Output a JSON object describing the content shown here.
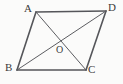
{
  "figure": {
    "kind": "geometry-diagram",
    "shape": "parallelogram",
    "background_color": "#fbfbfa",
    "stroke_color": "#55565a",
    "side_stroke_width": 1.6,
    "diagonal_stroke_width": 1.0,
    "width": 123,
    "height": 84,
    "labels": {
      "a": "A",
      "b": "B",
      "c": "C",
      "d": "D",
      "o": "O"
    },
    "vertices": [
      {
        "name": "A",
        "x": 36,
        "y": 12
      },
      {
        "name": "D",
        "x": 106,
        "y": 11
      },
      {
        "name": "C",
        "x": 86,
        "y": 70
      },
      {
        "name": "B",
        "x": 17,
        "y": 70
      },
      {
        "name": "O",
        "x": 58,
        "y": 42
      }
    ],
    "edges": [
      {
        "name": "AD",
        "from": "A",
        "to": "D",
        "type": "side"
      },
      {
        "name": "DC",
        "from": "D",
        "to": "C",
        "type": "side"
      },
      {
        "name": "CB",
        "from": "C",
        "to": "B",
        "type": "side"
      },
      {
        "name": "BA",
        "from": "B",
        "to": "A",
        "type": "side"
      },
      {
        "name": "AC",
        "from": "A",
        "to": "C",
        "type": "diagonal"
      },
      {
        "name": "BD",
        "from": "B",
        "to": "D",
        "type": "diagonal"
      }
    ]
  }
}
